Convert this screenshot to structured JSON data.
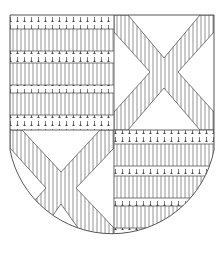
{
  "figure": {
    "colors": {
      "line": "#555555",
      "hatch": "#777777",
      "ermine": "#444444",
      "field": "#ffffff"
    },
    "quarters": [
      {
        "position": "dexter-chief",
        "charge": "barry",
        "bands": [
          "ermine",
          "hatched",
          "ermine",
          "hatched",
          "ermine",
          "hatched",
          "ermine"
        ]
      },
      {
        "position": "sinister-chief",
        "charge": "saltire",
        "saltire_tincture": "hatched",
        "field": "argent"
      },
      {
        "position": "dexter-base",
        "charge": "saltire",
        "saltire_tincture": "hatched",
        "field": "argent"
      },
      {
        "position": "sinister-base",
        "charge": "barry",
        "bands": [
          "ermine",
          "hatched",
          "ermine",
          "hatched",
          "ermine",
          "hatched",
          "ermine"
        ]
      }
    ]
  }
}
